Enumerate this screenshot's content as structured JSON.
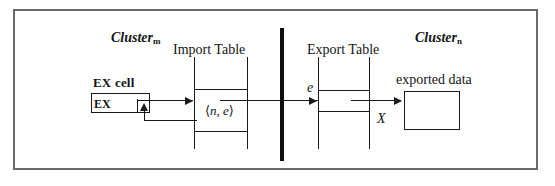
{
  "figure": {
    "kind": "diagram",
    "labels": {
      "cluster_m": "Cluster",
      "cluster_m_sub": "m",
      "cluster_n": "Cluster",
      "cluster_n_sub": "n",
      "import_table": "Import Table",
      "export_table": "Export Table",
      "ex_cell": "EX cell",
      "ex_box": "EX",
      "tuple_open": "⟨",
      "tuple_n": "n",
      "tuple_comma": ", ",
      "tuple_e": "e",
      "tuple_close": "⟩",
      "edge_e": "e",
      "edge_X": "X",
      "exported_data": "exported data"
    },
    "colors": {
      "frame": "#6b6b6b",
      "stroke": "#1a1a1a",
      "divider": "#0f0f0f",
      "background": "#ffffff",
      "text": "#141414"
    }
  }
}
